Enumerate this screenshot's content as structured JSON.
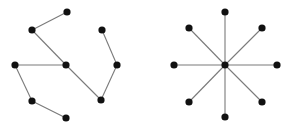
{
  "colors": {
    "background": "#ffffff",
    "edge": "#7a7a7a",
    "node": "#111111"
  },
  "node_radius": 3.6,
  "edge_width": 1.1,
  "graphs": [
    {
      "name": "tree-graph",
      "nodes": [
        {
          "id": "a",
          "x": 67,
          "y": 12
        },
        {
          "id": "b",
          "x": 32,
          "y": 30
        },
        {
          "id": "c",
          "x": 66,
          "y": 65
        },
        {
          "id": "d",
          "x": 15,
          "y": 65
        },
        {
          "id": "e",
          "x": 32,
          "y": 101
        },
        {
          "id": "f",
          "x": 66,
          "y": 118
        },
        {
          "id": "g",
          "x": 102,
          "y": 30
        },
        {
          "id": "h",
          "x": 117,
          "y": 65
        },
        {
          "id": "i",
          "x": 101,
          "y": 100
        }
      ],
      "edges": [
        [
          "a",
          "b"
        ],
        [
          "b",
          "c"
        ],
        [
          "c",
          "d"
        ],
        [
          "d",
          "e"
        ],
        [
          "e",
          "f"
        ],
        [
          "c",
          "i"
        ],
        [
          "i",
          "h"
        ],
        [
          "h",
          "g"
        ]
      ]
    },
    {
      "name": "star-graph",
      "nodes": [
        {
          "id": "center",
          "x": 225,
          "y": 65
        },
        {
          "id": "n",
          "x": 225,
          "y": 12
        },
        {
          "id": "ne",
          "x": 262,
          "y": 28
        },
        {
          "id": "e",
          "x": 277,
          "y": 65
        },
        {
          "id": "se",
          "x": 262,
          "y": 102
        },
        {
          "id": "s",
          "x": 225,
          "y": 117
        },
        {
          "id": "sw",
          "x": 189,
          "y": 102
        },
        {
          "id": "w",
          "x": 174,
          "y": 65
        },
        {
          "id": "nw",
          "x": 189,
          "y": 28
        }
      ],
      "edges": [
        [
          "center",
          "n"
        ],
        [
          "center",
          "ne"
        ],
        [
          "center",
          "e"
        ],
        [
          "center",
          "se"
        ],
        [
          "center",
          "s"
        ],
        [
          "center",
          "sw"
        ],
        [
          "center",
          "w"
        ],
        [
          "center",
          "nw"
        ]
      ]
    }
  ]
}
